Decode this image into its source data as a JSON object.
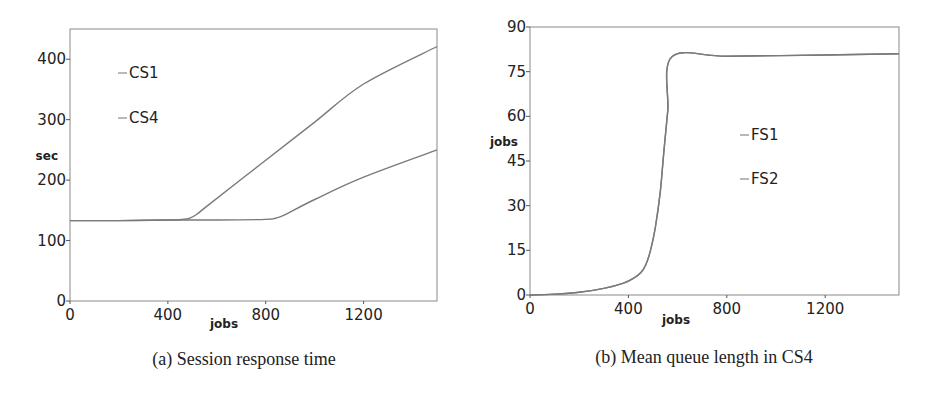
{
  "chart_data": [
    {
      "type": "line",
      "caption": "(a) Session response time",
      "xlabel": "jobs",
      "ylabel": "sec",
      "xlim": [
        0,
        1500
      ],
      "ylim": [
        0,
        450
      ],
      "xticks": [
        0,
        400,
        800,
        1200
      ],
      "yticks": [
        0,
        100,
        200,
        300,
        400
      ],
      "grid": false,
      "legend_position": "top-left",
      "series": [
        {
          "name": "CS1",
          "x": [
            0,
            200,
            400,
            600,
            800,
            840,
            880,
            1000,
            1200,
            1500
          ],
          "y": [
            133,
            133,
            134,
            134,
            135,
            137,
            143,
            168,
            205,
            250
          ]
        },
        {
          "name": "CS4",
          "x": [
            0,
            200,
            400,
            460,
            490,
            520,
            560,
            800,
            1000,
            1200,
            1500
          ],
          "y": [
            133,
            133,
            134,
            135,
            137,
            144,
            157,
            233,
            296,
            359,
            421
          ]
        }
      ]
    },
    {
      "type": "line",
      "caption": "(b) Mean queue length in CS4",
      "xlabel": "jobs",
      "ylabel": "jobs",
      "xlim": [
        0,
        1500
      ],
      "ylim": [
        0,
        90
      ],
      "xticks": [
        0,
        400,
        800,
        1200
      ],
      "yticks": [
        0,
        15,
        30,
        45,
        60,
        75,
        90
      ],
      "grid": false,
      "legend_position": "center-right",
      "series": [
        {
          "name": "FS1",
          "x": [
            0,
            100,
            200,
            300,
            380,
            420,
            450,
            470,
            490,
            510,
            530,
            545,
            560,
            577,
            800,
            1200,
            1500
          ],
          "y": [
            0,
            0.3,
            0.9,
            2.2,
            4.0,
            5.6,
            7.5,
            10,
            15,
            23,
            35,
            49,
            62,
            80,
            80.2,
            80.6,
            81
          ]
        },
        {
          "name": "FS2",
          "x": [
            0,
            100,
            200,
            300,
            380,
            420,
            450,
            470,
            490,
            510,
            530,
            545,
            560,
            577,
            800,
            1200,
            1500
          ],
          "y": [
            0,
            0.3,
            0.9,
            2.2,
            4.0,
            5.6,
            7.5,
            10,
            15,
            23,
            35,
            49,
            62,
            80,
            80.2,
            80.6,
            81
          ]
        }
      ]
    }
  ]
}
